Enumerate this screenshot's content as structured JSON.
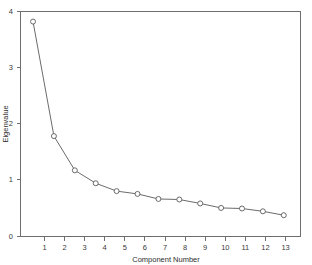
{
  "chart_data": {
    "type": "line",
    "title": "",
    "subtitle": "",
    "xlabel": "Component Number",
    "ylabel": "Eigenvalue",
    "categories": [
      "1",
      "2",
      "3",
      "4",
      "5",
      "6",
      "7",
      "8",
      "9",
      "10",
      "11",
      "12",
      "13"
    ],
    "x": [
      1,
      2,
      3,
      4,
      5,
      6,
      7,
      8,
      9,
      10,
      11,
      12,
      13
    ],
    "values": [
      3.82,
      1.78,
      1.17,
      0.94,
      0.8,
      0.75,
      0.66,
      0.65,
      0.58,
      0.5,
      0.49,
      0.44,
      0.37
    ],
    "series": [
      {
        "name": "Eigenvalue",
        "values": [
          3.82,
          1.78,
          1.17,
          0.94,
          0.8,
          0.75,
          0.66,
          0.65,
          0.58,
          0.5,
          0.49,
          0.44,
          0.37
        ]
      }
    ],
    "xlim": [
      0.4,
      13.8
    ],
    "ylim": [
      0,
      4
    ],
    "xticks": [
      1,
      2,
      3,
      4,
      5,
      6,
      7,
      8,
      9,
      10,
      11,
      12,
      13
    ],
    "xticklabels": [
      "1",
      "2",
      "3",
      "4",
      "5",
      "6",
      "7",
      "8",
      "9",
      "10",
      "11",
      "12",
      "13"
    ],
    "yticks": [
      0,
      1,
      2,
      3,
      4
    ],
    "yticklabels": [
      "0",
      "1",
      "2",
      "3",
      "4"
    ],
    "grid": false,
    "legend": false,
    "legend_position": "none",
    "marker": "open-circle",
    "annotations": [],
    "colors": {
      "line": "#5a5a5a",
      "marker_fill": "#ffffff",
      "marker_stroke": "#5a5a5a",
      "frame": "#6e6e6e",
      "text": "#3a3a3a",
      "background": "#ffffff"
    }
  }
}
